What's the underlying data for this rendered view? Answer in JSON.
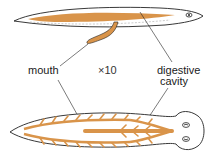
{
  "labels": {
    "mouth": "mouth",
    "magnification": "×10",
    "digestive_line1": "digestive",
    "digestive_line2": "cavity"
  },
  "colors": {
    "gut": "#d9944a",
    "outline": "#222222",
    "body_fill": "#ffffff"
  },
  "figures": [
    {
      "name": "side-view",
      "description": "planarian side view with pharynx extended"
    },
    {
      "name": "top-view",
      "description": "planarian dorsal view with branched digestive cavity"
    }
  ]
}
